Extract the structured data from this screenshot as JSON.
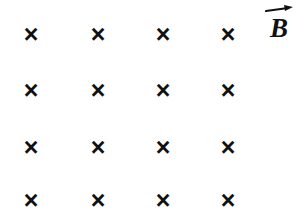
{
  "figure": {
    "name": "magnetic-field-into-page-with-circular-loop",
    "background_color": "#ffffff",
    "ink_color": "#111111",
    "width": 306,
    "height": 223
  },
  "field": {
    "symbol": "×",
    "icon_name": "field-into-page-x",
    "meaning_label": "×",
    "columns_x": [
      31,
      98,
      163,
      228
    ],
    "rows_y": [
      34,
      90,
      147,
      200
    ],
    "marks": [
      {
        "id": "x-r1c1",
        "symbol": "×",
        "x": 31,
        "y": 34,
        "inside_loop": false
      },
      {
        "id": "x-r1c2",
        "symbol": "×",
        "x": 98,
        "y": 34,
        "inside_loop": false
      },
      {
        "id": "x-r1c3",
        "symbol": "×",
        "x": 163,
        "y": 34,
        "inside_loop": false
      },
      {
        "id": "x-r1c4",
        "symbol": "×",
        "x": 228,
        "y": 34,
        "inside_loop": false
      },
      {
        "id": "x-r2c1",
        "symbol": "×",
        "x": 31,
        "y": 90,
        "inside_loop": false
      },
      {
        "id": "x-r2c2",
        "symbol": "×",
        "x": 98,
        "y": 90,
        "inside_loop": true
      },
      {
        "id": "x-r2c3",
        "symbol": "×",
        "x": 163,
        "y": 90,
        "inside_loop": true
      },
      {
        "id": "x-r2c4",
        "symbol": "×",
        "x": 228,
        "y": 90,
        "inside_loop": false
      },
      {
        "id": "x-r3c1",
        "symbol": "×",
        "x": 31,
        "y": 147,
        "inside_loop": false
      },
      {
        "id": "x-r3c2",
        "symbol": "×",
        "x": 98,
        "y": 147,
        "inside_loop": true
      },
      {
        "id": "x-r3c3",
        "symbol": "×",
        "x": 163,
        "y": 147,
        "inside_loop": true
      },
      {
        "id": "x-r3c4",
        "symbol": "×",
        "x": 228,
        "y": 147,
        "inside_loop": false
      },
      {
        "id": "x-r4c1",
        "symbol": "×",
        "x": 31,
        "y": 200,
        "inside_loop": false
      },
      {
        "id": "x-r4c2",
        "symbol": "×",
        "x": 98,
        "y": 200,
        "inside_loop": false
      },
      {
        "id": "x-r4c3",
        "symbol": "×",
        "x": 163,
        "y": 200,
        "inside_loop": false
      },
      {
        "id": "x-r4c4",
        "symbol": "×",
        "x": 228,
        "y": 200,
        "inside_loop": false
      }
    ]
  },
  "loop": {
    "name": "conducting-loop",
    "center_x": 130,
    "center_y": 119,
    "radius_x": 71,
    "radius_y": 75,
    "stroke_color": "#111111",
    "stroke_width": 2.6
  },
  "labels": {
    "field_vector": {
      "letter": "B",
      "arrow_icon": "vector-arrow-right-icon"
    }
  }
}
